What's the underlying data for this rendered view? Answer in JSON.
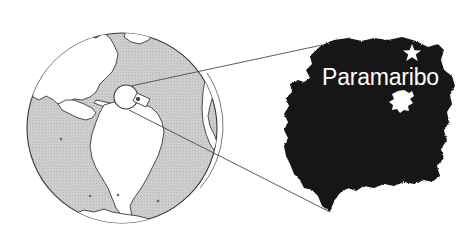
{
  "figure": {
    "name": "suriname-locator-map",
    "width": 475,
    "height": 251,
    "background_color": "#ffffff"
  },
  "globe": {
    "name": "world-globe-inset",
    "center": [
      122,
      128
    ],
    "radius": 96,
    "ocean_color": "#c9c9c9",
    "land_color": "#ffffff",
    "outline_color": "#3a3a3a",
    "visible_continents": [
      "North America",
      "Central America",
      "Caribbean",
      "South America",
      "Greenland",
      "Antarctica",
      "West Africa",
      "Europe"
    ]
  },
  "locator": {
    "name": "country-locator-circle",
    "label": "",
    "center": [
      126,
      97
    ],
    "radius": 12,
    "stroke_color": "#3a3a3a"
  },
  "callout": {
    "name": "callout-lines",
    "stroke_color": "#4a4a4a",
    "lines": [
      {
        "from": [
          131,
          86
        ],
        "to": [
          322,
          45
        ]
      },
      {
        "from": [
          129,
          110
        ],
        "to": [
          330,
          212
        ]
      }
    ]
  },
  "country": {
    "name": "suriname-silhouette",
    "fill_color": "#141414",
    "bounds": [
      283,
      37,
      455,
      215
    ]
  },
  "capital": {
    "name": "Paramaribo",
    "label": "Paramaribo",
    "label_color": "#ffffff",
    "label_position": [
      322,
      85
    ],
    "star_marker": {
      "name": "capital-star-marker",
      "position": [
        412,
        52
      ],
      "color": "#ffffff"
    }
  },
  "reservoir": {
    "name": "brokopondo-reservoir",
    "label": "",
    "position": [
      402,
      101
    ],
    "color": "#ffffff"
  }
}
